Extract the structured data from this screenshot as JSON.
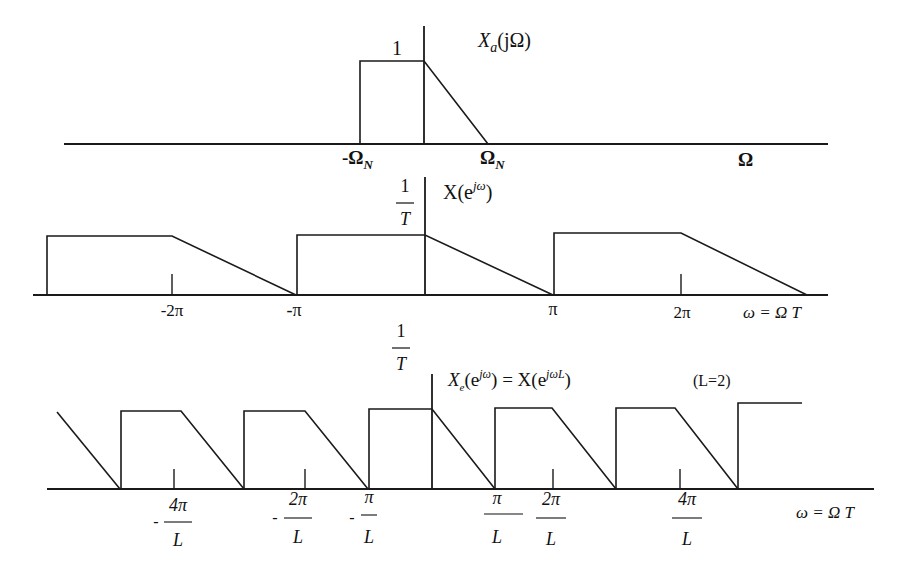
{
  "panels": [
    {
      "id": "analog",
      "title": "X_a(jΩ)",
      "title_main": "X",
      "title_sub": "a",
      "title_rest": "(jΩ)",
      "peak_label": "1",
      "axis_label": "Ω",
      "ticks": [
        {
          "label": "-Ω",
          "sub": "N"
        },
        {
          "label": "Ω",
          "sub": "N"
        }
      ]
    },
    {
      "id": "sampled",
      "title": "X(e^{jω})",
      "title_main": "X(e",
      "title_sup": "jω",
      "title_rest": ")",
      "peak_num": "1",
      "peak_den": "T",
      "axis_label": "ω = Ω T",
      "ticks": [
        "-2π",
        "-π",
        "π",
        "2π"
      ]
    },
    {
      "id": "expanded",
      "title": "X_e(e^{jω}) = X(e^{jωL})",
      "title_main": "X",
      "title_sub": "e",
      "title_mid1": "(e",
      "title_sup1": "jω",
      "title_mid2": ") = X(e",
      "title_sup2": "jωL",
      "title_rest": ")",
      "note": "(L=2)",
      "peak_num": "1",
      "peak_den": "T",
      "axis_label": "ω = Ω T",
      "ticks": [
        {
          "sign": "-",
          "num": "4π",
          "den": "L"
        },
        {
          "sign": "-",
          "num": "2π",
          "den": "L"
        },
        {
          "sign": "-",
          "num": "π",
          "den": "L"
        },
        {
          "sign": "",
          "num": "π",
          "den": "L"
        },
        {
          "sign": "",
          "num": "2π",
          "den": "L"
        },
        {
          "sign": "",
          "num": "4π",
          "den": "L"
        }
      ]
    }
  ]
}
